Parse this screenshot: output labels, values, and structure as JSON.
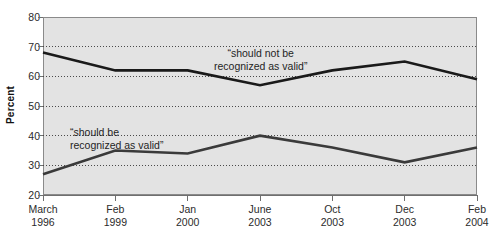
{
  "chart_data": {
    "type": "line",
    "title": "",
    "xlabel": "",
    "ylabel": "Percent",
    "ylim": [
      20,
      80
    ],
    "ytick_values": [
      20,
      30,
      40,
      50,
      60,
      70,
      80
    ],
    "ytick_labels": [
      "20",
      "30",
      "40",
      "50",
      "60",
      "70",
      "80"
    ],
    "grid": "horizontal-dotted",
    "legend_position": "inline-annotations",
    "categories": [
      "March 1996",
      "Feb 1999",
      "Jan 2000",
      "June 2003",
      "Oct 2003",
      "Dec 2003",
      "Feb 2004"
    ],
    "xtick_labels": [
      {
        "month": "March",
        "year": "1996"
      },
      {
        "month": "Feb",
        "year": "1999"
      },
      {
        "month": "Jan",
        "year": "2000"
      },
      {
        "month": "June",
        "year": "2003"
      },
      {
        "month": "Oct",
        "year": "2003"
      },
      {
        "month": "Dec",
        "year": "2003"
      },
      {
        "month": "Feb",
        "year": "2004"
      }
    ],
    "series": [
      {
        "name": "“should not be recognized as valid”",
        "values": [
          68,
          62,
          62,
          57,
          62,
          65,
          59
        ],
        "color": "#1a1a1a"
      },
      {
        "name": "“should be recognized as valid”",
        "values": [
          27,
          35,
          34,
          40,
          36,
          31,
          36
        ],
        "color": "#3a3a3a"
      }
    ],
    "annotations": [
      {
        "id": "upper",
        "line1": "“should not be",
        "line2": "recognized as valid”"
      },
      {
        "id": "lower",
        "line1": "“should be",
        "line2": "recognized as valid”"
      }
    ],
    "colors": {
      "plot_background": "#e3e3e3",
      "axis": "#6f6f6f",
      "gridline": "#4a4a4a",
      "series_upper": "#1a1a1a",
      "series_lower": "#3a3a3a",
      "page_background": "#ffffff"
    }
  }
}
